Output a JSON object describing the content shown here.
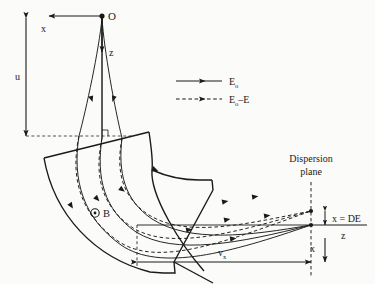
{
  "figure": {
    "kind": "physics-diagram",
    "background_color": "#fbfbf9",
    "ink_color": "#1a1a1a"
  },
  "labels": {
    "source_point": "O",
    "axis_x_top": "x",
    "axis_z_top": "z",
    "dimension_u": "u",
    "field_symbol": "B",
    "field_glyph": "⊙",
    "dispersion_plane_line1": "Dispersion",
    "dispersion_plane_line2": "plane",
    "focal_offset": "x = DE",
    "axis_z_right": "z",
    "axis_x_right": "x",
    "dimension_vx_v": "v",
    "dimension_vx_sub": "x"
  },
  "legend": {
    "entries": [
      {
        "name": "solid-beam",
        "style": "solid",
        "label_main": "E",
        "label_sub": "o"
      },
      {
        "name": "dashed-beam",
        "style": "dashed",
        "label_main": "E",
        "label_sub": "o",
        "label_tail": "–E"
      }
    ]
  },
  "geometry": {
    "source": {
      "x": 102,
      "y": 16
    },
    "entry_plane_y": 136,
    "dispersion_plane_x": 311,
    "focus_solid_y": 225,
    "focus_dashed_y": 211
  }
}
